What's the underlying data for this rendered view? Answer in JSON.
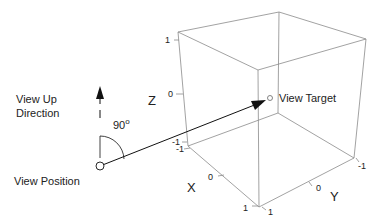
{
  "labels": {
    "view_up": "View Up",
    "direction": "Direction",
    "view_position": "View Position",
    "view_target": "View Target",
    "angle": "90",
    "angle_unit": "o"
  },
  "axes": {
    "x": {
      "label": "X",
      "ticks": [
        "-1",
        "0",
        "1"
      ]
    },
    "y": {
      "label": "Y",
      "ticks": [
        "1",
        "0",
        "-1"
      ]
    },
    "z": {
      "label": "Z",
      "ticks": [
        "1",
        "0",
        "-1"
      ]
    }
  },
  "colors": {
    "box_edge": "#888888",
    "arrow": "#111111",
    "text": "#222222"
  }
}
